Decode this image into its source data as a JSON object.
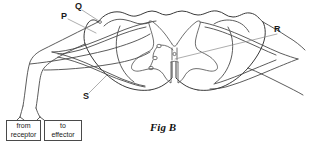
{
  "figure": {
    "caption": "Fig B",
    "caption_position": {
      "x": 150,
      "y": 121
    },
    "background_color": "#ffffff",
    "line_color": "#4a4a4a",
    "leader_color": "#8a8a8a",
    "width": 309,
    "height": 152
  },
  "labels": [
    {
      "id": "P",
      "text": "P",
      "x": 61,
      "y": 12,
      "leader": "M 68 19 L 96 33"
    },
    {
      "id": "Q",
      "text": "Q",
      "x": 75,
      "y": 2,
      "leader": "M 82 10 L 99 21"
    },
    {
      "id": "R",
      "text": "R",
      "x": 274,
      "y": 25,
      "leader": "M 277 34 L 175 59"
    },
    {
      "id": "S",
      "text": "S",
      "x": 83,
      "y": 92,
      "leader": "M 89 93 L 107 75"
    }
  ],
  "boxes": [
    {
      "id": "from-receptor",
      "line1": "from",
      "line2": "receptor",
      "x": 6,
      "y": 120,
      "width": 35,
      "height": 21
    },
    {
      "id": "to-effector",
      "line1": "to",
      "line2": "effector",
      "x": 44,
      "y": 120,
      "width": 38,
      "height": 21
    }
  ],
  "structures": {
    "cord_outline_name": "spinal-cord-outline",
    "gray_matter_name": "gray-matter-butterfly",
    "left_root_name": "left-nerve-root",
    "right_root_name": "right-nerve-root",
    "cell_bodies_count": 3,
    "ventral_fissure_name": "ventral-median-fissure"
  }
}
